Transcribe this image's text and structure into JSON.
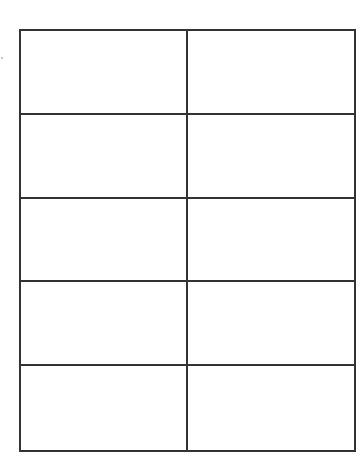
{
  "sheet": {
    "columns": 2,
    "rows": 5,
    "line_color": "#333333",
    "cells": [
      [
        "",
        ""
      ],
      [
        "",
        ""
      ],
      [
        "",
        ""
      ],
      [
        "",
        ""
      ],
      [
        "",
        ""
      ]
    ]
  }
}
